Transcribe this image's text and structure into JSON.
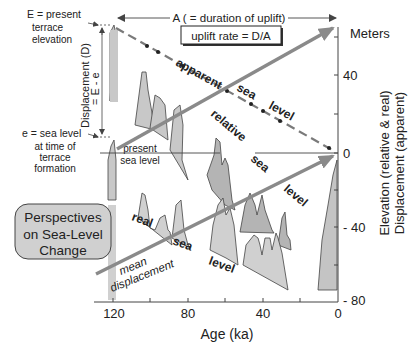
{
  "figure": {
    "title_box": [
      "Perspectives",
      "on Sea-Level",
      "Change"
    ],
    "top_label": "A ( = duration of uplift)",
    "uplift_box": "uplift rate = D/A",
    "meters_label": "Meters",
    "left_annotations": {
      "E_line1": "E  = present",
      "E_line2": "terrace",
      "E_line3": "elevation",
      "displacement_line1": "Displacement (D)",
      "displacement_line2": "= E - e",
      "e_line1": "e = sea level",
      "e_line2": "at time of",
      "e_line3": "terrace",
      "e_line4": "formation"
    },
    "present_sea_level": [
      "present",
      "sea level"
    ],
    "curve_labels": {
      "apparent": "apparent",
      "apparent_sea": "sea",
      "apparent_level": "level",
      "relative": "relative",
      "relative_sea": "sea",
      "relative_level": "level",
      "real": "real",
      "real_sea": "sea",
      "real_level": "level",
      "mean": "mean",
      "displacement": "displacement"
    },
    "x_axis": {
      "label": "Age (ka)",
      "ticks": [
        "120",
        "80",
        "40",
        "0"
      ],
      "tick_values": [
        120,
        100,
        80,
        60,
        40,
        20,
        0
      ]
    },
    "y_axis": {
      "label_line1": "Elevation (relative & real)",
      "label_line2": "Displacement (apparent)",
      "ticks": [
        "40",
        "0",
        "- 40",
        "- 80"
      ]
    },
    "colors": {
      "fill_light": "#cfcfcf",
      "fill_mid": "#b4b4b4",
      "arrow_gray": "#8a8a8a",
      "dashed_gray": "#7a7a7a",
      "box_fill": "#d0d0d0"
    }
  }
}
